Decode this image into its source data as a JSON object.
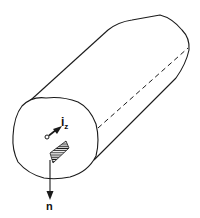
{
  "figure": {
    "type": "line-art 3D prism with unit vectors",
    "labels": {
      "axis_vector": "i",
      "axis_subscript": "z",
      "normal_vector": "n"
    },
    "colors": {
      "stroke": "#1a1a1a",
      "background": "#ffffff"
    },
    "elements": [
      "front cross-section face",
      "elongated prism body",
      "dashed hidden edge",
      "axial unit vector i_z",
      "hatched surface element",
      "outward normal vector n"
    ]
  }
}
